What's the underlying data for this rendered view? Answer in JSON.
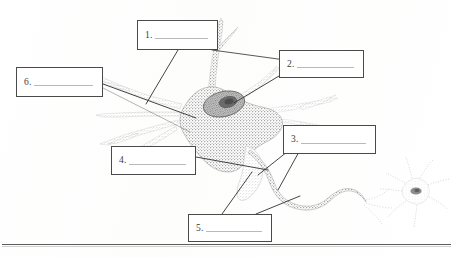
{
  "document": {
    "title": "Neuron Structure Labeling Worksheet",
    "kind": "labeled-diagram-worksheet",
    "subject": "neuron anatomy"
  },
  "labels": [
    {
      "id": 1,
      "number": "1.",
      "answer": "",
      "blank": true,
      "box": "top-center",
      "points_to": "apical dendrite branch above cell body"
    },
    {
      "id": 2,
      "number": "2.",
      "answer": "",
      "blank": true,
      "box": "top-right",
      "points_to": "nucleus inside cell body"
    },
    {
      "id": 3,
      "number": "3.",
      "answer": "",
      "blank": true,
      "box": "middle-right",
      "points_to": "axon"
    },
    {
      "id": 4,
      "number": "4.",
      "answer": "",
      "blank": true,
      "box": "middle-left",
      "points_to": "dendrite on lower left of cell body"
    },
    {
      "id": 5,
      "number": "5.",
      "answer": "",
      "blank": true,
      "box": "bottom-center",
      "points_to": "axon hillock and axon region"
    },
    {
      "id": 6,
      "number": "6.",
      "answer": "",
      "blank": true,
      "box": "upper-left",
      "points_to": "cell body (soma)"
    }
  ],
  "diagram": {
    "name": "neuron",
    "parts": [
      "cell body",
      "nucleus",
      "nucleolus",
      "dendrites",
      "axon hillock",
      "axon",
      "axon terminal",
      "adjacent neuron"
    ],
    "style": "stippled grayscale line drawing"
  },
  "colors": {
    "ink": "#4a4a4a",
    "rule": "#b9b9b9",
    "paper": "#ffffff",
    "soma_fill": "#a9a9a9",
    "nucleus_fill": "#7a7a7a",
    "nucleolus_fill": "#4f4f4f",
    "leader_line": "#3a3a3a"
  }
}
